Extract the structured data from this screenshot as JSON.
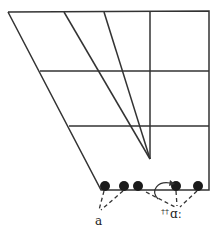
{
  "diagram": {
    "type": "vowel-quadrilateral",
    "colors": {
      "line": "#333333",
      "dot": "#1a1a1a",
      "background": "#ffffff"
    },
    "labels": {
      "left": "a",
      "right": "ɑː",
      "right_superscript": "††"
    },
    "points": [
      {
        "name": "front-open-1",
        "x": 105,
        "y": 186
      },
      {
        "name": "front-open-2",
        "x": 124,
        "y": 186
      },
      {
        "name": "central-open",
        "x": 138,
        "y": 186
      },
      {
        "name": "back-open-1",
        "x": 176,
        "y": 186
      },
      {
        "name": "back-open-2",
        "x": 198,
        "y": 186
      }
    ]
  }
}
